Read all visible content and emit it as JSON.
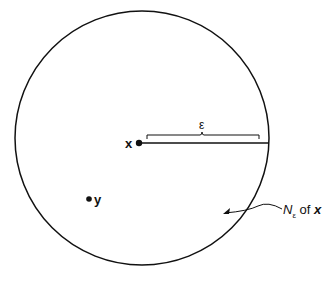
{
  "diagram": {
    "point_x_label": "x",
    "point_y_label": "y",
    "epsilon_label": "ε",
    "neighborhood_label": {
      "N": "N",
      "sub": "ε",
      "of": " of ",
      "x": "x"
    },
    "colors": {
      "stroke": "#111111",
      "background": "#ffffff"
    }
  }
}
